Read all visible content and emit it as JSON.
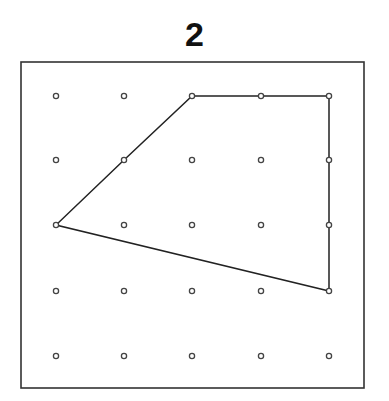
{
  "figure": {
    "label": "2"
  },
  "grid": {
    "columns": 5,
    "rows": 5,
    "x_positions": [
      56,
      124,
      192,
      261,
      329
    ],
    "y_positions": [
      96,
      160,
      225,
      291,
      356
    ]
  },
  "frame": {
    "x": 21,
    "y": 62,
    "width": 343,
    "height": 326
  },
  "polygon": {
    "vertices_grid": [
      [
        2,
        0
      ],
      [
        4,
        0
      ],
      [
        4,
        3
      ],
      [
        0,
        2
      ],
      [
        1,
        1
      ]
    ],
    "stroke_color": "#222222"
  },
  "colors": {
    "line": "#222222",
    "dot": "#444444",
    "background": "#ffffff"
  }
}
